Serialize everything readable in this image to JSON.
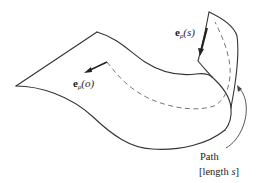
{
  "diagram": {
    "title": "",
    "colors": {
      "line": "#333333",
      "dashed_path": "#666666",
      "text": "#222222",
      "background": "#ffffff"
    },
    "labels": {
      "start_vector": {
        "bold": "e",
        "subscript": "ρ",
        "argument": "(o)"
      },
      "end_vector": {
        "bold": "e",
        "subscript": "ρ",
        "argument": "(s)"
      },
      "path": {
        "line1": "Path",
        "line2_prefix": "[length ",
        "line2_var": "s",
        "line2_suffix": "]"
      }
    }
  }
}
